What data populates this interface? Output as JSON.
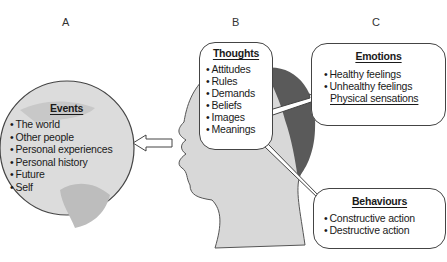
{
  "columns": {
    "a": "A",
    "b": "B",
    "c": "C"
  },
  "events": {
    "title": "Events",
    "items": [
      "The world",
      "Other people",
      "Personal experiences",
      "Personal history",
      "Future",
      "Self"
    ]
  },
  "thoughts": {
    "title": "Thoughts",
    "items": [
      "Attitudes",
      "Rules",
      "Demands",
      "Beliefs",
      "Images",
      "Meanings"
    ]
  },
  "emotions": {
    "title": "Emotions",
    "items": [
      "Healthy feelings",
      "Unhealthy feelings"
    ],
    "extra": "Physical sensations"
  },
  "behaviours": {
    "title": "Behaviours",
    "items": [
      "Constructive action",
      "Destructive action"
    ]
  },
  "icons": {
    "globe": "globe-icon",
    "head": "head-profile-icon",
    "arrows": [
      "arrow-left-icon",
      "arrow-right-up-icon",
      "arrow-right-down-icon"
    ]
  },
  "colors": {
    "outline": "#444444",
    "globe_fill": "#d9d9d9",
    "head_fill": "#d6d6d6",
    "hair_fill": "#555555"
  }
}
